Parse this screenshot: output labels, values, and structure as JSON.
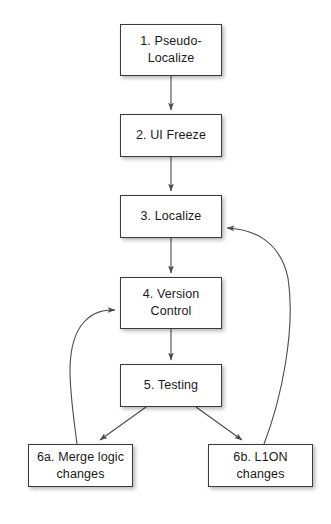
{
  "diagram": {
    "type": "flowchart",
    "title": "",
    "background_color": "#ffffff",
    "node_fill": "#ffffff",
    "node_border_color": "#3a3a3a",
    "edge_color": "#4a4a4a",
    "nodes": [
      {
        "id": "n1",
        "label": "1. Pseudo-\nLocalize",
        "x": 120,
        "y": 24,
        "w": 102,
        "h": 52
      },
      {
        "id": "n2",
        "label": "2. UI Freeze",
        "x": 120,
        "y": 114,
        "w": 102,
        "h": 43
      },
      {
        "id": "n3",
        "label": "3. Localize",
        "x": 120,
        "y": 195,
        "w": 102,
        "h": 43
      },
      {
        "id": "n4",
        "label": "4. Version\nControl",
        "x": 120,
        "y": 277,
        "w": 102,
        "h": 52
      },
      {
        "id": "n5",
        "label": "5. Testing",
        "x": 120,
        "y": 364,
        "w": 102,
        "h": 43
      },
      {
        "id": "n6a",
        "label": "6a. Merge logic\nchanges",
        "x": 28,
        "y": 444,
        "w": 105,
        "h": 43
      },
      {
        "id": "n6b",
        "label": "6b. L1ON\nchanges",
        "x": 208,
        "y": 444,
        "w": 105,
        "h": 43
      }
    ],
    "edges": [
      {
        "from": "n1",
        "to": "n2",
        "kind": "straight"
      },
      {
        "from": "n2",
        "to": "n3",
        "kind": "straight"
      },
      {
        "from": "n3",
        "to": "n4",
        "kind": "straight"
      },
      {
        "from": "n4",
        "to": "n5",
        "kind": "straight"
      },
      {
        "from": "n5",
        "to": "n6a",
        "kind": "diagonal"
      },
      {
        "from": "n5",
        "to": "n6b",
        "kind": "diagonal"
      },
      {
        "from": "n6a",
        "to": "n4",
        "kind": "curved-feedback-left"
      },
      {
        "from": "n6b",
        "to": "n3",
        "kind": "curved-feedback-right"
      }
    ]
  }
}
